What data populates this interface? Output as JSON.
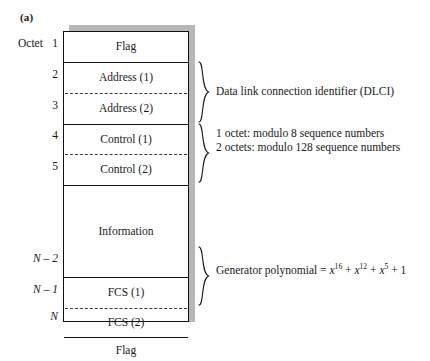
{
  "figure": {
    "label": "(a)",
    "octet_header": "Octet"
  },
  "octet_numbers": [
    {
      "label": "1",
      "italic": false
    },
    {
      "label": "2",
      "italic": false
    },
    {
      "label": "3",
      "italic": false
    },
    {
      "label": "4",
      "italic": false
    },
    {
      "label": "5",
      "italic": false
    },
    {
      "label": "N – 2",
      "italic": true
    },
    {
      "label": "N – 1",
      "italic": true
    },
    {
      "label": "N",
      "italic": true
    }
  ],
  "frame_fields": [
    {
      "name": "flag-top",
      "label": "Flag"
    },
    {
      "name": "address-1",
      "label": "Address (1)"
    },
    {
      "name": "address-2",
      "label": "Address (2)"
    },
    {
      "name": "control-1",
      "label": "Control (1)"
    },
    {
      "name": "control-2",
      "label": "Control (2)"
    },
    {
      "name": "information",
      "label": "Information"
    },
    {
      "name": "fcs-1",
      "label": "FCS (1)"
    },
    {
      "name": "fcs-2",
      "label": "FCS (2)"
    },
    {
      "name": "flag-bottom",
      "label": "Flag"
    }
  ],
  "annotations": {
    "dlci": "Data link connection identifier (DLCI)",
    "control_line_1": "1 octet: modulo 8 sequence numbers",
    "control_line_2": "2 octets: modulo 128 sequence numbers",
    "generator_prefix": "Generator polynomial = ",
    "generator_terms": [
      {
        "base": "x",
        "exp": "16",
        "op": " + "
      },
      {
        "base": "x",
        "exp": "12",
        "op": " + "
      },
      {
        "base": "x",
        "exp": "5",
        "op": " + "
      }
    ],
    "generator_constant": "1"
  },
  "colors": {
    "ink": "#111111",
    "shadow": "#b9b7b5",
    "page": "#fefefe",
    "dash": "#3a3a3a"
  }
}
